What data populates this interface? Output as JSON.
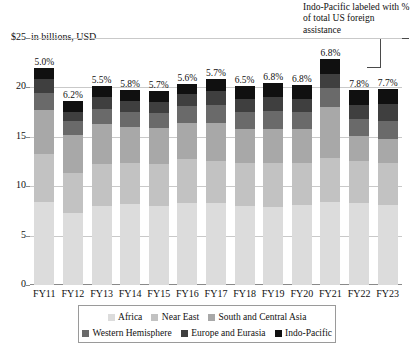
{
  "annotation": {
    "text": "Indo-Pacific labeled with % of total US foreign assistance"
  },
  "axis": {
    "title": "in billions, USD",
    "y_top_label": "$25",
    "y_ticks": [
      "$25",
      "20",
      "15",
      "10",
      "5",
      "0"
    ],
    "y_tick_values": [
      25,
      20,
      15,
      10,
      5,
      0
    ],
    "ylim": [
      0,
      25
    ]
  },
  "legend": {
    "items": [
      {
        "label": "Africa",
        "color": "#dcdcdc"
      },
      {
        "label": "Near East",
        "color": "#c2c2c2"
      },
      {
        "label": "South and Central Asia",
        "color": "#a8a8a8"
      },
      {
        "label": "Western Hemisphere",
        "color": "#6a6a6a"
      },
      {
        "label": "Europe and Eurasia",
        "color": "#3f3f3f"
      },
      {
        "label": "Indo-Pacific",
        "color": "#101010"
      }
    ]
  },
  "chart_data": {
    "type": "bar",
    "subtype": "stacked",
    "title": "",
    "subtitle": "in billions, USD",
    "xlabel": "",
    "ylabel": "in billions, USD",
    "ylim": [
      0,
      25
    ],
    "yticks": [
      0,
      5,
      10,
      15,
      20,
      25
    ],
    "grid": true,
    "legend_position": "bottom",
    "annotation": "Indo-Pacific labeled with % of total US foreign assistance",
    "categories": [
      "FY11",
      "FY12",
      "FY13",
      "FY14",
      "FY15",
      "FY16",
      "FY17",
      "FY18",
      "FY19",
      "FY20",
      "FY21",
      "FY22",
      "FY23"
    ],
    "series": [
      {
        "name": "Africa",
        "color": "#dcdcdc",
        "values": [
          8.4,
          7.3,
          8.0,
          8.2,
          8.0,
          8.3,
          8.3,
          8.0,
          7.9,
          8.1,
          8.4,
          8.3,
          8.1
        ]
      },
      {
        "name": "Near East",
        "color": "#c2c2c2",
        "values": [
          4.9,
          4.0,
          4.2,
          4.2,
          4.3,
          4.5,
          4.3,
          4.4,
          4.4,
          4.3,
          4.5,
          4.3,
          4.3
        ]
      },
      {
        "name": "South and Central Asia",
        "color": "#a8a8a8",
        "values": [
          4.4,
          3.9,
          4.1,
          3.6,
          3.6,
          3.6,
          3.8,
          3.4,
          3.5,
          3.4,
          5.1,
          2.5,
          2.4
        ]
      },
      {
        "name": "Western Hemisphere",
        "color": "#6a6a6a",
        "values": [
          1.7,
          1.4,
          1.5,
          1.5,
          1.5,
          1.7,
          1.8,
          1.7,
          1.8,
          1.7,
          1.9,
          1.7,
          1.8
        ]
      },
      {
        "name": "Europe and Eurasia",
        "color": "#3f3f3f",
        "values": [
          1.5,
          0.9,
          1.2,
          1.1,
          1.1,
          1.2,
          1.4,
          1.3,
          1.4,
          1.3,
          1.5,
          1.4,
          1.7
        ]
      },
      {
        "name": "Indo-Pacific",
        "color": "#101010",
        "values": [
          1.1,
          1.1,
          1.1,
          1.1,
          1.1,
          1.1,
          1.3,
          1.3,
          1.4,
          1.4,
          1.5,
          1.5,
          1.5
        ]
      }
    ],
    "data_labels": {
      "series": "Indo-Pacific",
      "note": "% of total US foreign assistance",
      "values": [
        "5.0%",
        "6.2%",
        "5.5%",
        "5.8%",
        "5.7%",
        "5.6%",
        "5.7%",
        "6.5%",
        "6.8%",
        "6.8%",
        "6.8%",
        "7.8%",
        "7.7%"
      ]
    },
    "totals": [
      22.0,
      18.6,
      20.1,
      19.7,
      19.6,
      20.4,
      20.9,
      20.1,
      20.4,
      20.2,
      22.9,
      19.7,
      19.8
    ]
  }
}
